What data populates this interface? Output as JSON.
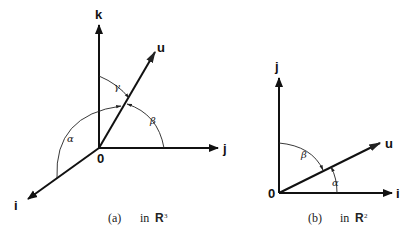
{
  "figure_a": {
    "axes": {
      "vertical": "k",
      "horizontal": "j",
      "diagonal": "i"
    },
    "vector": "u",
    "origin": "0",
    "angles": {
      "alpha": "α",
      "beta": "β",
      "gamma": "γ"
    },
    "caption": {
      "tag": "(a)",
      "text": "in",
      "space": "R",
      "dimension": "3"
    }
  },
  "figure_b": {
    "axes": {
      "vertical": "j",
      "horizontal": "i"
    },
    "vector": "u",
    "origin": "0",
    "angles": {
      "alpha": "α",
      "beta": "β"
    },
    "caption": {
      "tag": "(b)",
      "text": "in",
      "space": "R",
      "dimension": "2"
    }
  }
}
